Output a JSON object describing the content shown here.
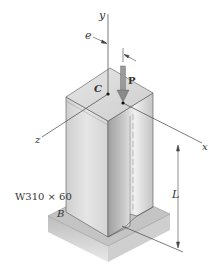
{
  "diagram": {
    "type": "engineering-figure",
    "labels": {
      "y_axis": "y",
      "x_axis": "x",
      "z_axis": "z",
      "eccentricity": "e",
      "load": "P",
      "centroid": "C",
      "base_point": "B",
      "length": "L",
      "section": "W310 × 60"
    },
    "colors": {
      "line": "#444444",
      "column_light": "#e4e4e4",
      "column_mid": "#cfcfcf",
      "column_dark": "#a9a9a9",
      "top_face": "#dcdcdc",
      "base_top": "#c8c8c8",
      "base_side": "#b5b5b5",
      "load_arrow": "#8a8a8a"
    }
  }
}
